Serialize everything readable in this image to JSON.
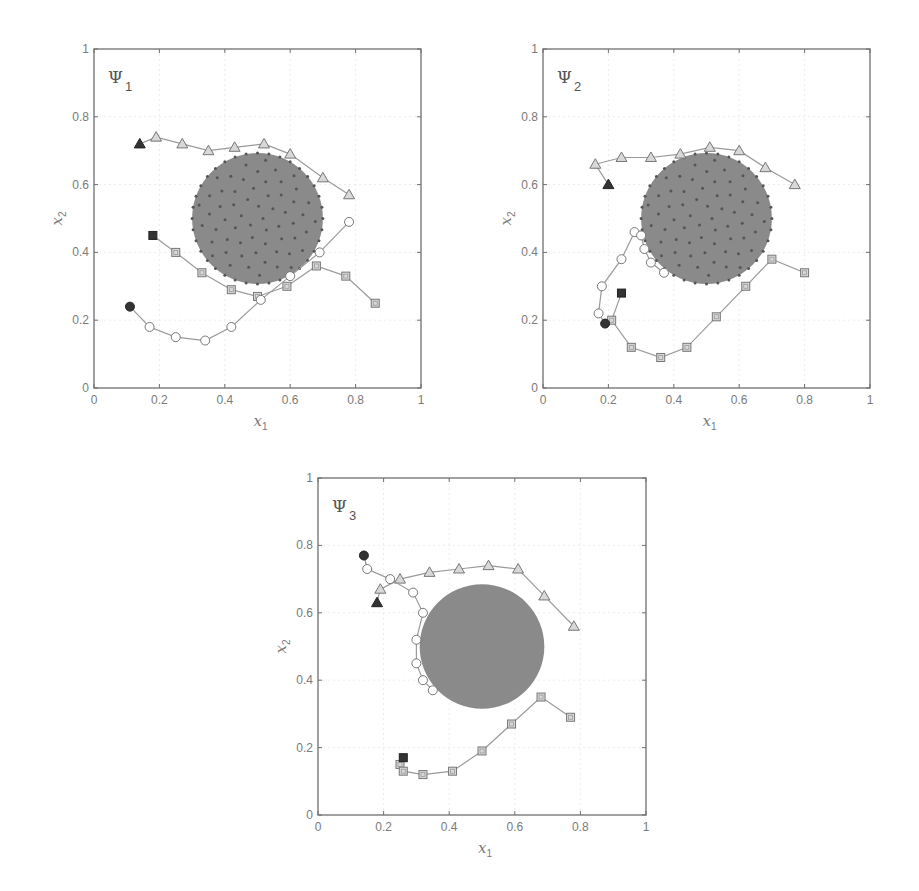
{
  "chart_data": [
    {
      "type": "scatter",
      "title": "Ψ1",
      "panel_label": "Ψ",
      "panel_sub": "1",
      "xlabel": "x",
      "xlabel_sub": "1",
      "ylabel": "x",
      "ylabel_sub": "2",
      "xlim": [
        0,
        1
      ],
      "ylim": [
        0,
        1
      ],
      "xticks": [
        "0",
        "0.2",
        "0.4",
        "0.6",
        "0.8",
        "1"
      ],
      "yticks": [
        "0",
        "0.2",
        "0.4",
        "0.6",
        "0.8",
        "1"
      ],
      "grid": true,
      "obstacle": {
        "cx": 0.5,
        "cy": 0.5,
        "r": 0.2,
        "color": "#8a8a8a",
        "dotted": true
      },
      "series": [
        {
          "name": "triangle",
          "marker": "triangle",
          "start": [
            0.14,
            0.72
          ],
          "points": [
            [
              0.19,
              0.74
            ],
            [
              0.27,
              0.72
            ],
            [
              0.35,
              0.7
            ],
            [
              0.43,
              0.71
            ],
            [
              0.52,
              0.72
            ],
            [
              0.6,
              0.69
            ],
            [
              0.7,
              0.62
            ],
            [
              0.78,
              0.57
            ]
          ]
        },
        {
          "name": "square",
          "marker": "square",
          "start": [
            0.18,
            0.45
          ],
          "points": [
            [
              0.25,
              0.4
            ],
            [
              0.33,
              0.34
            ],
            [
              0.42,
              0.29
            ],
            [
              0.5,
              0.27
            ],
            [
              0.59,
              0.3
            ],
            [
              0.68,
              0.36
            ],
            [
              0.77,
              0.33
            ],
            [
              0.86,
              0.25
            ]
          ]
        },
        {
          "name": "circle",
          "marker": "circle",
          "start": [
            0.11,
            0.24
          ],
          "points": [
            [
              0.17,
              0.18
            ],
            [
              0.25,
              0.15
            ],
            [
              0.34,
              0.14
            ],
            [
              0.42,
              0.18
            ],
            [
              0.51,
              0.26
            ],
            [
              0.6,
              0.33
            ],
            [
              0.69,
              0.4
            ],
            [
              0.78,
              0.49
            ]
          ]
        }
      ]
    },
    {
      "type": "scatter",
      "title": "Ψ2",
      "panel_label": "Ψ",
      "panel_sub": "2",
      "xlabel": "x",
      "xlabel_sub": "1",
      "ylabel": "x",
      "ylabel_sub": "2",
      "xlim": [
        0,
        1
      ],
      "ylim": [
        0,
        1
      ],
      "xticks": [
        "0",
        "0.2",
        "0.4",
        "0.6",
        "0.8",
        "1"
      ],
      "yticks": [
        "0",
        "0.2",
        "0.4",
        "0.6",
        "0.8",
        "1"
      ],
      "grid": true,
      "obstacle": {
        "cx": 0.5,
        "cy": 0.5,
        "r": 0.2,
        "color": "#8a8a8a",
        "dotted": true
      },
      "series": [
        {
          "name": "triangle",
          "marker": "triangle",
          "start": [
            0.2,
            0.6
          ],
          "points": [
            [
              0.16,
              0.66
            ],
            [
              0.24,
              0.68
            ],
            [
              0.33,
              0.68
            ],
            [
              0.42,
              0.69
            ],
            [
              0.51,
              0.71
            ],
            [
              0.6,
              0.7
            ],
            [
              0.68,
              0.65
            ],
            [
              0.77,
              0.6
            ]
          ]
        },
        {
          "name": "square",
          "marker": "square",
          "start": [
            0.24,
            0.28
          ],
          "points": [
            [
              0.21,
              0.2
            ],
            [
              0.27,
              0.12
            ],
            [
              0.36,
              0.09
            ],
            [
              0.44,
              0.12
            ],
            [
              0.53,
              0.21
            ],
            [
              0.62,
              0.3
            ],
            [
              0.7,
              0.38
            ],
            [
              0.8,
              0.34
            ]
          ]
        },
        {
          "name": "circle",
          "marker": "circle",
          "start": [
            0.19,
            0.19
          ],
          "points": [
            [
              0.17,
              0.22
            ],
            [
              0.18,
              0.3
            ],
            [
              0.24,
              0.38
            ],
            [
              0.28,
              0.46
            ],
            [
              0.3,
              0.45
            ],
            [
              0.31,
              0.41
            ],
            [
              0.33,
              0.37
            ],
            [
              0.37,
              0.34
            ]
          ]
        }
      ]
    },
    {
      "type": "scatter",
      "title": "Ψ3",
      "panel_label": "Ψ",
      "panel_sub": "3",
      "xlabel": "x",
      "xlabel_sub": "1",
      "ylabel": "x",
      "ylabel_sub": "2",
      "xlim": [
        0,
        1
      ],
      "ylim": [
        0,
        1
      ],
      "xticks": [
        "0",
        "0.2",
        "0.4",
        "0.6",
        "0.8",
        "1"
      ],
      "yticks": [
        "0",
        "0.2",
        "0.4",
        "0.6",
        "0.8",
        "1"
      ],
      "grid": true,
      "obstacle": {
        "cx": 0.5,
        "cy": 0.5,
        "r": 0.19,
        "color": "#8a8a8a",
        "dotted": false
      },
      "series": [
        {
          "name": "triangle",
          "marker": "triangle",
          "start": [
            0.18,
            0.63
          ],
          "points": [
            [
              0.19,
              0.67
            ],
            [
              0.25,
              0.7
            ],
            [
              0.34,
              0.72
            ],
            [
              0.43,
              0.73
            ],
            [
              0.52,
              0.74
            ],
            [
              0.61,
              0.73
            ],
            [
              0.69,
              0.65
            ],
            [
              0.78,
              0.56
            ]
          ]
        },
        {
          "name": "square",
          "marker": "square",
          "start": [
            0.26,
            0.17
          ],
          "points": [
            [
              0.25,
              0.15
            ],
            [
              0.26,
              0.13
            ],
            [
              0.32,
              0.12
            ],
            [
              0.41,
              0.13
            ],
            [
              0.5,
              0.19
            ],
            [
              0.59,
              0.27
            ],
            [
              0.68,
              0.35
            ],
            [
              0.77,
              0.29
            ]
          ]
        },
        {
          "name": "circle",
          "marker": "circle",
          "start": [
            0.14,
            0.77
          ],
          "points": [
            [
              0.15,
              0.73
            ],
            [
              0.22,
              0.7
            ],
            [
              0.29,
              0.66
            ],
            [
              0.32,
              0.6
            ],
            [
              0.3,
              0.52
            ],
            [
              0.3,
              0.45
            ],
            [
              0.32,
              0.4
            ],
            [
              0.35,
              0.37
            ]
          ]
        }
      ]
    }
  ]
}
